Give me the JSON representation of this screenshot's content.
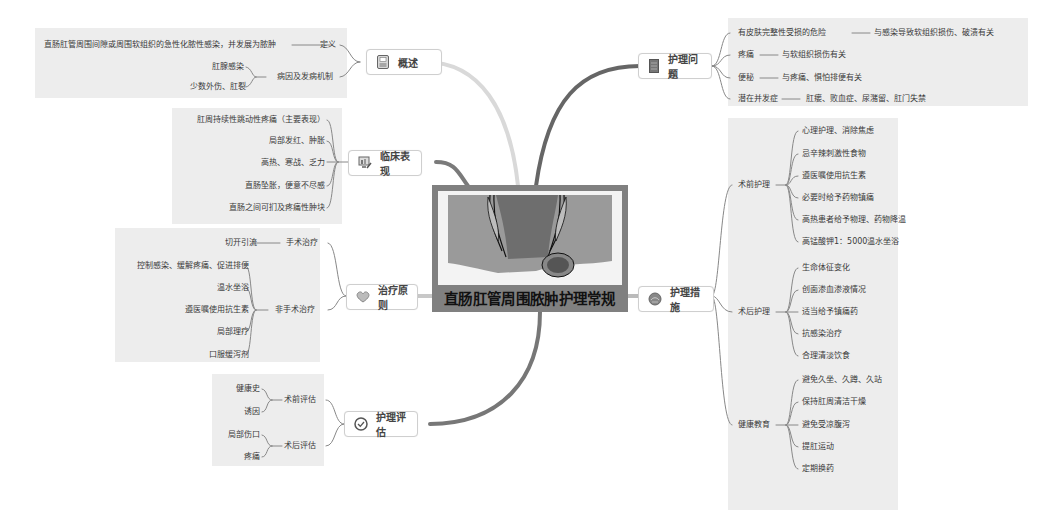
{
  "central_topic": {
    "title": "直肠肛管周围脓肿护理常规",
    "image": "anorectal-abscess-illustration"
  },
  "colors": {
    "background": "#ffffff",
    "panel": "#ededed",
    "center_box": "#808080",
    "branch_dark": "#666666",
    "branch_light": "#d6d6d6",
    "topic_border": "#cfcfcf"
  },
  "branches": {
    "overview": {
      "label": "概述",
      "icon": "document-icon",
      "children": [
        {
          "label": "定义",
          "children": [
            "直肠肛管周围间隙或周围软组织的急性化脓性感染，并发展为脓肿"
          ]
        },
        {
          "label": "病因及发病机制",
          "children": [
            "肛腺感染",
            "少数外伤、肛裂"
          ]
        }
      ]
    },
    "clinical": {
      "label": "临床表现",
      "icon": "computer-chart-icon",
      "children": [
        "肛周持续性跳动性疼痛（主要表现）",
        "局部发红、肿胀",
        "高热、寒战、乏力",
        "直肠坠胀，便意不尽感",
        "直肠之间可扪及疼痛性肿块"
      ]
    },
    "treatment": {
      "label": "治疗原则",
      "icon": "heart-icon",
      "children": [
        {
          "label": "手术治疗",
          "children": [
            "切开引流"
          ]
        },
        {
          "label": "非手术治疗",
          "children": [
            "控制感染、缓解疼痛、促进排便",
            "温水坐浴",
            "遵医嘱使用抗生素",
            "局部理疗",
            "口服缓泻剂"
          ]
        }
      ]
    },
    "assessment": {
      "label": "护理评估",
      "icon": "check-circle-icon",
      "children": [
        {
          "label": "术前评估",
          "children": [
            "健康史",
            "诱因"
          ]
        },
        {
          "label": "术后评估",
          "children": [
            "局部伤口",
            "疼痛"
          ]
        }
      ]
    },
    "problems": {
      "label": "护理问题",
      "icon": "notebook-icon",
      "children": [
        {
          "label": "有皮肤完整性受损的危险",
          "note": "与感染导致软组织损伤、破溃有关"
        },
        {
          "label": "疼痛",
          "note": "与软组织损伤有关"
        },
        {
          "label": "便秘",
          "note": "与疼痛、惧怕排便有关"
        },
        {
          "label": "潜在并发症",
          "note": "肛瘘、败血症、尿潴留、肛门失禁"
        }
      ]
    },
    "measures": {
      "label": "护理措施",
      "icon": "globe-icon",
      "children": [
        {
          "label": "术前护理",
          "children": [
            "心理护理、消除焦虑",
            "忌辛辣刺激性食物",
            "遵医嘱使用抗生素",
            "必要时给予药物镇痛",
            "高热患者给予物理、药物降温",
            "高锰酸钾1：5000温水坐浴"
          ]
        },
        {
          "label": "术后护理",
          "children": [
            "生命体征变化",
            "创面渗血渗液情况",
            "适当给予镇痛药",
            "抗感染治疗",
            "合理清淡饮食"
          ]
        },
        {
          "label": "健康教育",
          "children": [
            "避免久坐、久蹲、久站",
            "保持肛周清洁干燥",
            "避免受凉腹泻",
            "提肛运动",
            "定期换药"
          ]
        }
      ]
    }
  }
}
